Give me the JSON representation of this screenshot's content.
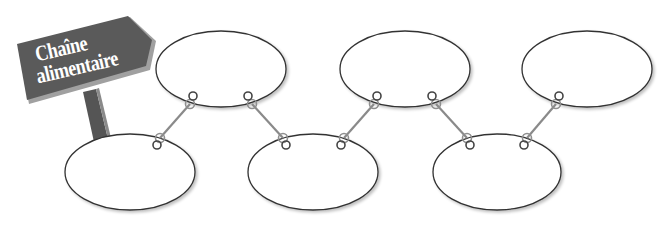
{
  "sign": {
    "line1": "Chaîne",
    "line2": "alimentaire"
  },
  "colors": {
    "sign_board": "#5a5a5a",
    "sign_edge": "#9a9a9a",
    "post": "#555555",
    "ellipse_stroke": "#333333",
    "connector_rod": "#8a8a8a",
    "ring_dark": "#444444",
    "ring_gray": "#8f8f8f",
    "background": "#ffffff"
  },
  "ellipses": [
    {
      "id": 1,
      "cx": 130,
      "cy": 172,
      "rx": 65,
      "ry": 38,
      "text": ""
    },
    {
      "id": 2,
      "cx": 221,
      "cy": 69,
      "rx": 65,
      "ry": 38,
      "text": ""
    },
    {
      "id": 3,
      "cx": 313,
      "cy": 172,
      "rx": 65,
      "ry": 38,
      "text": ""
    },
    {
      "id": 4,
      "cx": 405,
      "cy": 69,
      "rx": 65,
      "ry": 38,
      "text": ""
    },
    {
      "id": 5,
      "cx": 497,
      "cy": 172,
      "rx": 64,
      "ry": 38,
      "text": ""
    },
    {
      "id": 6,
      "cx": 587,
      "cy": 69,
      "rx": 65,
      "ry": 38,
      "text": ""
    }
  ],
  "connectors": [
    {
      "from": 1,
      "to": 2,
      "top_dark": [
        193,
        96
      ],
      "top_gray": [
        190,
        104
      ],
      "bottom_gray": [
        160,
        138
      ],
      "bottom_dark": [
        157,
        145
      ]
    },
    {
      "from": 2,
      "to": 3,
      "top_dark": [
        248,
        96
      ],
      "top_gray": [
        252,
        104
      ],
      "bottom_gray": [
        283,
        138
      ],
      "bottom_dark": [
        286,
        145
      ]
    },
    {
      "from": 3,
      "to": 4,
      "top_dark": [
        377,
        96
      ],
      "top_gray": [
        374,
        104
      ],
      "bottom_gray": [
        344,
        138
      ],
      "bottom_dark": [
        341,
        145
      ]
    },
    {
      "from": 4,
      "to": 5,
      "top_dark": [
        432,
        96
      ],
      "top_gray": [
        436,
        104
      ],
      "bottom_gray": [
        467,
        138
      ],
      "bottom_dark": [
        470,
        145
      ]
    },
    {
      "from": 5,
      "to": 6,
      "top_dark": [
        559,
        96
      ],
      "top_gray": [
        556,
        104
      ],
      "bottom_gray": [
        527,
        138
      ],
      "bottom_dark": [
        524,
        145
      ]
    }
  ]
}
